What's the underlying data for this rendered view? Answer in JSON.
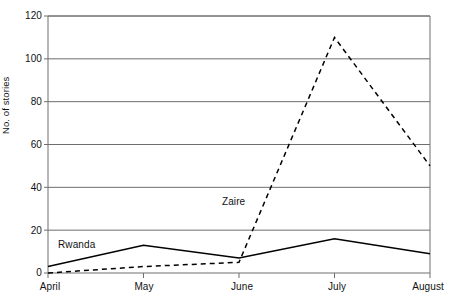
{
  "chart_data": {
    "type": "line",
    "title": "",
    "subtitle": "",
    "xlabel": "",
    "ylabel": "No. of stories",
    "categories": [
      "April",
      "May",
      "June",
      "July",
      "August"
    ],
    "series": [
      {
        "name": "Rwanda",
        "style": "solid",
        "color": "#000000",
        "values": [
          3,
          13,
          7,
          16,
          9
        ]
      },
      {
        "name": "Zaire",
        "style": "dashed",
        "color": "#000000",
        "values": [
          0,
          3,
          5,
          110,
          50
        ]
      }
    ],
    "ylim": [
      0,
      120
    ],
    "yticks": [
      0,
      20,
      40,
      60,
      80,
      100,
      120
    ],
    "ytick_labels": [
      "0",
      "20",
      "40",
      "60",
      "80",
      "100",
      "120"
    ],
    "xtick_labels": [
      "April",
      "May",
      "June",
      "July",
      "August"
    ],
    "grid": "horizontal",
    "legend_position": "inline-annotations",
    "annotations": [
      {
        "text": "Rwanda",
        "series": "Rwanda",
        "x": 58,
        "y": 240
      },
      {
        "text": "Zaire",
        "series": "Zaire",
        "x": 222,
        "y": 197
      }
    ],
    "frame": {
      "left": 48,
      "right": 430,
      "top": 16,
      "bottom": 273
    }
  }
}
